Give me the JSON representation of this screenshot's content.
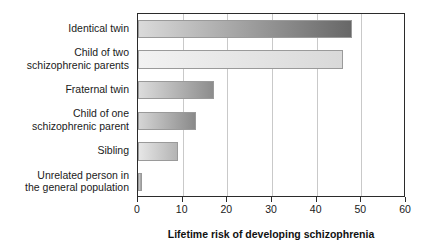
{
  "chart_data": {
    "type": "bar",
    "orientation": "horizontal",
    "title": "",
    "xlabel": "Lifetime risk of developing schizophrenia",
    "ylabel": "",
    "xlim": [
      0,
      60
    ],
    "xticks": [
      0,
      10,
      20,
      30,
      40,
      50,
      60
    ],
    "xtick_labels": [
      "0",
      "10",
      "20",
      "30",
      "40",
      "50",
      "60"
    ],
    "grid": true,
    "grid_axis": "x",
    "legend": false,
    "categories": [
      "Identical twin",
      "Child of two\nschizophrenic parents",
      "Fraternal twin",
      "Child of one\nschizophrenic parent",
      "Sibling",
      "Unrelated person in\nthe general population"
    ],
    "values": [
      48,
      46,
      17,
      13,
      9,
      1
    ],
    "bar_fills": [
      {
        "from": "#dadada",
        "to": "#676767"
      },
      {
        "from": "#f2f2f2",
        "to": "#d9d9d9"
      },
      {
        "from": "#dcdcdc",
        "to": "#8d8d8d"
      },
      {
        "from": "#d5d5d5",
        "to": "#8a8a8a"
      },
      {
        "from": "#e6e6e6",
        "to": "#b4b4b4"
      },
      {
        "from": "#d0d0d0",
        "to": "#9c9c9c"
      }
    ],
    "bar_border_color": "#9a9a9a",
    "axis_color": "#2b2b2b",
    "grid_color": "#c9c9c9",
    "text_color": "#1a1a1a",
    "background": "#ffffff"
  }
}
